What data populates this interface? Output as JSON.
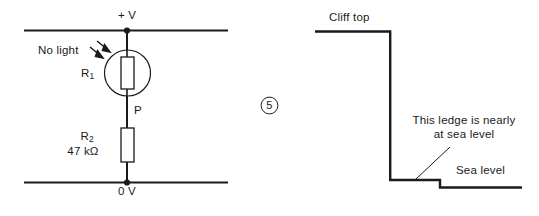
{
  "figure": {
    "question_number": "5",
    "stroke_color": "#1a1a1a",
    "background_color": "#ffffff"
  },
  "circuit": {
    "supply_top_label": "+ V",
    "supply_bottom_label": "0 V",
    "ldr_label_base": "R",
    "ldr_label_sub": "1",
    "light_annotation": "No light",
    "midpoint_label": "P",
    "resistor_label_base": "R",
    "resistor_label_sub": "2",
    "resistor_value": "47 kΩ"
  },
  "cliff": {
    "cliff_top_label": "Cliff top",
    "sea_level_label": "Sea level",
    "ledge_note_line1": "This ledge is nearly",
    "ledge_note_line2": "at sea level"
  }
}
